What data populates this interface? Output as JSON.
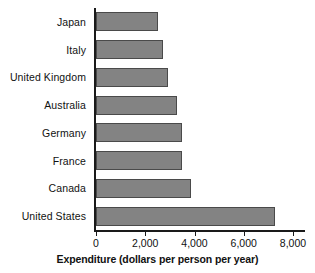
{
  "chart_data": {
    "type": "bar",
    "orientation": "horizontal",
    "title": "",
    "xlabel": "Expenditure (dollars per person per year)",
    "ylabel": "",
    "categories": [
      "Japan",
      "Italy",
      "United Kingdom",
      "Australia",
      "Germany",
      "France",
      "Canada",
      "United States"
    ],
    "values": [
      2500,
      2730,
      2940,
      3300,
      3500,
      3500,
      3840,
      7270
    ],
    "xlim": [
      0,
      8000
    ],
    "xticks": [
      0,
      2000,
      4000,
      6000,
      8000
    ],
    "xtick_labels": [
      "0",
      "2,000",
      "4,000",
      "6,000",
      "8,000"
    ],
    "grid": false,
    "legend": false,
    "bar_color": "#838383",
    "bar_edge_color": "#4a4a4a",
    "axis_color": "#1a1a1a"
  }
}
